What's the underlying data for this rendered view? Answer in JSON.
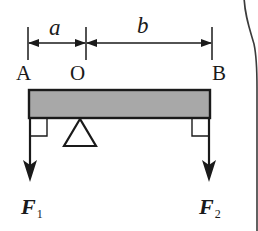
{
  "figure": {
    "background_color": "#ffffff",
    "line_color": "#1a1a1a",
    "beam_fill_color": "#a8a8a8",
    "beam_stroke_color": "#1a1a1a",
    "frame_color": "#3b3b3b"
  },
  "dimensions": [
    {
      "id": "a",
      "label": "a",
      "from": "A",
      "to": "O",
      "style": "double-arrow"
    },
    {
      "id": "b",
      "label": "b",
      "from": "O",
      "to": "B",
      "style": "double-arrow"
    }
  ],
  "points": [
    {
      "id": "A",
      "label": "A"
    },
    {
      "id": "O",
      "label": "O"
    },
    {
      "id": "B",
      "label": "B"
    }
  ],
  "forces": [
    {
      "id": "F1",
      "symbol": "F",
      "subscript": "1",
      "direction": "down",
      "applied_at": "A"
    },
    {
      "id": "F2",
      "symbol": "F",
      "subscript": "2",
      "direction": "down",
      "applied_at": "B"
    }
  ],
  "annotations": {
    "fulcrum": "triangle-support",
    "right_angle_left": "right-angle-marker",
    "right_angle_right": "right-angle-marker"
  }
}
